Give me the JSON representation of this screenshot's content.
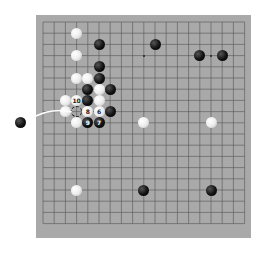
{
  "board": {
    "size": 19,
    "background": "#a9a9a9",
    "line_color": "#555555",
    "origin_x": 43,
    "origin_y": 22,
    "spacing": 11.2
  },
  "stones": [
    {
      "color": "white",
      "col": 3,
      "row": 1,
      "label": ""
    },
    {
      "color": "black",
      "col": 5,
      "row": 2,
      "label": ""
    },
    {
      "color": "black",
      "col": 10,
      "row": 2,
      "label": ""
    },
    {
      "color": "white",
      "col": 3,
      "row": 3,
      "label": ""
    },
    {
      "color": "black",
      "col": 14,
      "row": 3,
      "label": ""
    },
    {
      "color": "black",
      "col": 16,
      "row": 3,
      "label": ""
    },
    {
      "color": "black",
      "col": 5,
      "row": 4,
      "label": ""
    },
    {
      "color": "white",
      "col": 3,
      "row": 5,
      "label": ""
    },
    {
      "color": "white",
      "col": 4,
      "row": 5,
      "label": ""
    },
    {
      "color": "black",
      "col": 5,
      "row": 5,
      "label": ""
    },
    {
      "color": "black",
      "col": 4,
      "row": 6,
      "label": ""
    },
    {
      "color": "white",
      "col": 5,
      "row": 6,
      "label": ""
    },
    {
      "color": "black",
      "col": 6,
      "row": 6,
      "label": ""
    },
    {
      "color": "white",
      "col": 2,
      "row": 7,
      "label": ""
    },
    {
      "color": "white",
      "col": 3,
      "row": 7,
      "label": "10"
    },
    {
      "color": "black",
      "col": 4,
      "row": 7,
      "label": ""
    },
    {
      "color": "white",
      "col": 5,
      "row": 7,
      "label": ""
    },
    {
      "color": "white",
      "col": 2,
      "row": 8,
      "label": ""
    },
    {
      "color": "white",
      "col": 4,
      "row": 8,
      "label": "8"
    },
    {
      "color": "white",
      "col": 5,
      "row": 8,
      "label": "6"
    },
    {
      "color": "black",
      "col": 6,
      "row": 8,
      "label": ""
    },
    {
      "color": "white",
      "col": 3,
      "row": 9,
      "label": ""
    },
    {
      "color": "black",
      "col": 4,
      "row": 9,
      "label": "9"
    },
    {
      "color": "black",
      "col": 5,
      "row": 9,
      "label": "7"
    },
    {
      "color": "white",
      "col": 9,
      "row": 9,
      "label": ""
    },
    {
      "color": "white",
      "col": 15,
      "row": 9,
      "label": ""
    },
    {
      "color": "white",
      "col": 3,
      "row": 15,
      "label": ""
    },
    {
      "color": "black",
      "col": 9,
      "row": 15,
      "label": ""
    },
    {
      "color": "black",
      "col": 15,
      "row": 15,
      "label": ""
    }
  ],
  "markers": [
    {
      "type": "dashed-circle",
      "col": 3,
      "row": 8
    }
  ],
  "hoshi": [
    {
      "col": 9,
      "row": 3
    },
    {
      "col": 15,
      "row": 3
    }
  ],
  "loose_stone": {
    "color": "black"
  }
}
